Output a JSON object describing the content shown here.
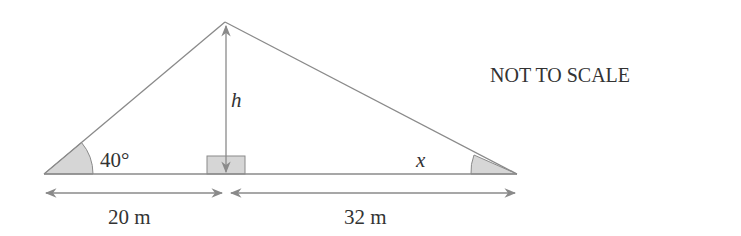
{
  "diagram": {
    "note": "NOT TO SCALE",
    "angle_left": "40°",
    "angle_right": "x",
    "height_label": "h",
    "base_left": "20 m",
    "base_right": "32 m"
  },
  "colors": {
    "line": "#8a8a8a",
    "fill": "#d6d6d6",
    "text": "#333333"
  }
}
